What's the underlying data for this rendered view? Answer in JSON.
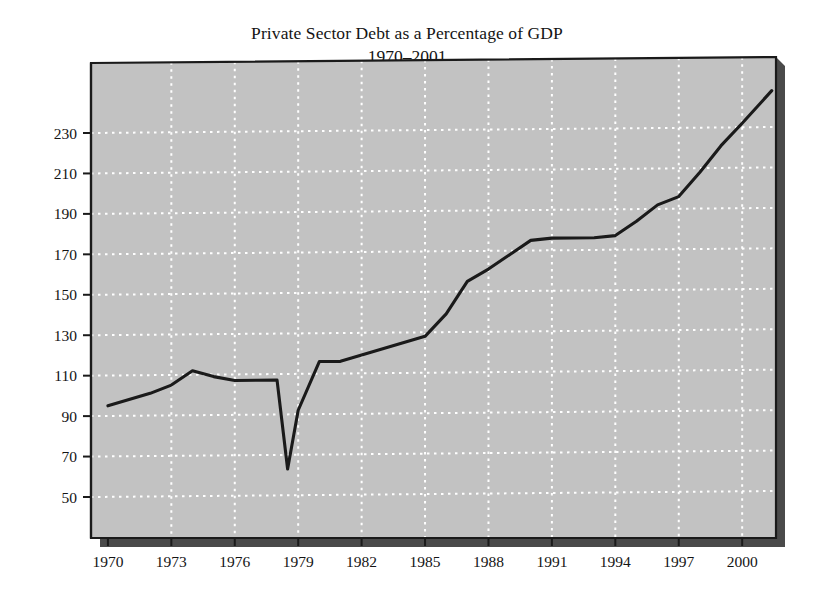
{
  "chart_data": {
    "type": "line",
    "title": "Private Sector Debt as a Percentage of GDP",
    "subtitle": "1970–2001",
    "xlabel": "",
    "ylabel": "Percentage",
    "xlim": [
      1969.2,
      2001.6
    ],
    "ylim": [
      40,
      252
    ],
    "grid": true,
    "legend": false,
    "legend_position": "none",
    "xticks": [
      1970,
      1973,
      1976,
      1979,
      1982,
      1985,
      1988,
      1991,
      1994,
      1997,
      2000
    ],
    "xtick_labels": [
      "1970",
      "1973",
      "1976",
      "1979",
      "1982",
      "1985",
      "1988",
      "1991",
      "1994",
      "1997",
      "2000"
    ],
    "yticks": [
      50,
      70,
      90,
      110,
      130,
      150,
      170,
      190,
      210,
      230
    ],
    "ytick_labels": [
      "50",
      "70",
      "90",
      "110",
      "130",
      "150",
      "170",
      "190",
      "210",
      "230"
    ],
    "series": [
      {
        "name": "Private Sector Debt (% of GDP)",
        "color": "#1a1a1a",
        "x": [
          1970,
          1971,
          1972,
          1973,
          1974,
          1975,
          1976,
          1977,
          1978,
          1978.5,
          1979,
          1980,
          1981,
          1982,
          1983,
          1984,
          1985,
          1986,
          1987,
          1988,
          1989,
          1990,
          1991,
          1992,
          1993,
          1994,
          1995,
          1996,
          1997,
          1998,
          1999,
          2000,
          2001.4
        ],
        "y": [
          95,
          98,
          101,
          105,
          112,
          109,
          107,
          107,
          107,
          63,
          92,
          116,
          116,
          119,
          122,
          125,
          128,
          139,
          155,
          161,
          168,
          175,
          176,
          176,
          176,
          177,
          184,
          192,
          196,
          208,
          221,
          232,
          248
        ]
      }
    ],
    "plot_background": "#c2c2c2",
    "grid_color": "#ffffff",
    "frame_color": "#1a1a1a",
    "shadow_color": "#4a4a4a",
    "page_background": "#ffffff"
  },
  "axes": {
    "y_axis_title": "Percentage"
  }
}
